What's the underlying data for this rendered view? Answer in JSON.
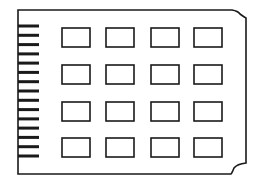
{
  "diagram": {
    "stroke_color": "#1a1a1a",
    "background_color": "#ffffff",
    "board": {
      "left": 18,
      "top": 10,
      "right": 246,
      "bottom": 174,
      "notch_top_right": {
        "x_start": 232,
        "y_end": 18
      },
      "notch_bottom_right": {
        "y_start": 163,
        "x_end": 231
      }
    },
    "edge_connector": {
      "finger_count": 15,
      "x_start": 18,
      "x_end": 39,
      "y_first": 26,
      "y_last": 156,
      "thickness": 3
    },
    "chips": {
      "rows": 4,
      "cols": 4,
      "col_x": [
        62,
        106,
        151,
        194
      ],
      "row_y": [
        28,
        65,
        102,
        138
      ],
      "width": 28,
      "height": 19
    }
  }
}
